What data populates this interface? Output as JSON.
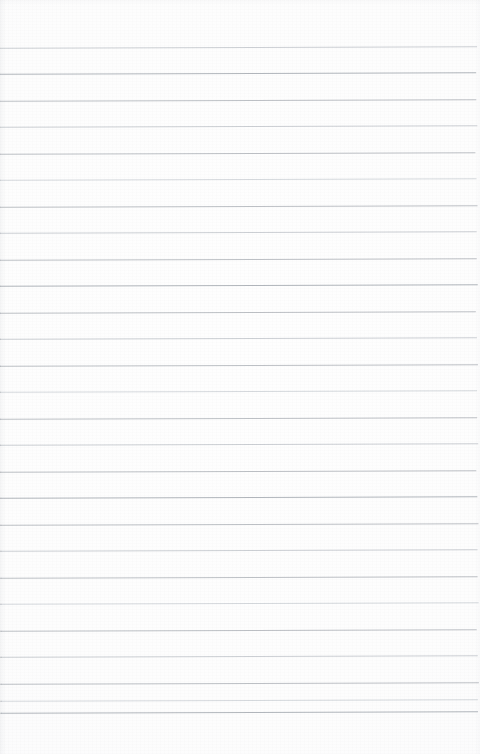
{
  "document": {
    "kind": "scanned-lined-paper",
    "title": "Blank lined notebook page",
    "visible_text": "",
    "page_width": 480,
    "page_height": 754,
    "paper_color": "#fdfdfd",
    "rule_color": "#b9bdc2",
    "content": {
      "headings": [],
      "paragraphs": [],
      "notes": []
    },
    "ruling": {
      "line_count": 27,
      "first_line_y": 47,
      "last_line_y": 712,
      "line_spacing": 26.6,
      "line_thickness": 1,
      "left_inset": 0,
      "right_inset": 3,
      "top_margin": 47,
      "bottom_margin": 42,
      "margin_rule": "none",
      "skew_degrees": -0.16,
      "lines": [
        {
          "y": 47,
          "tone": "soft",
          "left": 0,
          "right": 2
        },
        {
          "y": 73,
          "tone": "dark",
          "left": 0,
          "right": 3
        },
        {
          "y": 100,
          "tone": "rule",
          "left": 0,
          "right": 3
        },
        {
          "y": 126,
          "tone": "soft",
          "left": 0,
          "right": 2
        },
        {
          "y": 153,
          "tone": "rule",
          "left": 0,
          "right": 4
        },
        {
          "y": 179,
          "tone": "light",
          "left": 0,
          "right": 3
        },
        {
          "y": 206,
          "tone": "rule",
          "left": 0,
          "right": 2
        },
        {
          "y": 232,
          "tone": "soft",
          "left": 0,
          "right": 3
        },
        {
          "y": 259,
          "tone": "rule",
          "left": 0,
          "right": 3
        },
        {
          "y": 285,
          "tone": "dark",
          "left": 0,
          "right": 2
        },
        {
          "y": 312,
          "tone": "rule",
          "left": 0,
          "right": 4
        },
        {
          "y": 338,
          "tone": "soft",
          "left": 0,
          "right": 3
        },
        {
          "y": 365,
          "tone": "rule",
          "left": 0,
          "right": 2
        },
        {
          "y": 391,
          "tone": "light",
          "left": 0,
          "right": 3
        },
        {
          "y": 418,
          "tone": "rule",
          "left": 0,
          "right": 3
        },
        {
          "y": 444,
          "tone": "soft",
          "left": 0,
          "right": 2
        },
        {
          "y": 471,
          "tone": "rule",
          "left": 0,
          "right": 4
        },
        {
          "y": 497,
          "tone": "dark",
          "left": 0,
          "right": 3
        },
        {
          "y": 524,
          "tone": "rule",
          "left": 0,
          "right": 2
        },
        {
          "y": 550,
          "tone": "soft",
          "left": 0,
          "right": 3
        },
        {
          "y": 577,
          "tone": "rule",
          "left": 0,
          "right": 3
        },
        {
          "y": 603,
          "tone": "light",
          "left": 0,
          "right": 2
        },
        {
          "y": 630,
          "tone": "rule",
          "left": 0,
          "right": 4
        },
        {
          "y": 656,
          "tone": "soft",
          "left": 0,
          "right": 3
        },
        {
          "y": 683,
          "tone": "rule",
          "left": 0,
          "right": 2
        },
        {
          "y": 700,
          "tone": "light",
          "left": 0,
          "right": 3
        },
        {
          "y": 712,
          "tone": "dark",
          "left": 0,
          "right": 3
        }
      ]
    }
  }
}
